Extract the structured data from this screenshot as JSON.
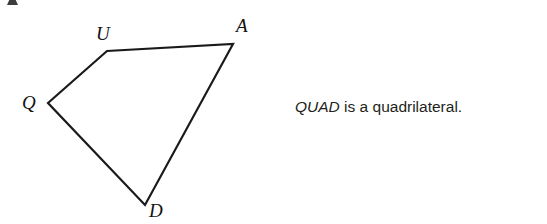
{
  "canvas": {
    "width": 547,
    "height": 224,
    "background_color": "#ffffff"
  },
  "figure": {
    "name": "QUAD",
    "shape_type": "quadrilateral",
    "stroke_color": "#1a1a1a",
    "stroke_width": 2.2,
    "fill": "none",
    "vertices": [
      {
        "label": "Q",
        "x": 48,
        "y": 103,
        "label_x": 22,
        "label_y": 93
      },
      {
        "label": "U",
        "x": 107,
        "y": 51,
        "label_x": 96,
        "label_y": 24
      },
      {
        "label": "A",
        "x": 233,
        "y": 44,
        "label_x": 236,
        "label_y": 16
      },
      {
        "label": "D",
        "x": 145,
        "y": 205,
        "label_x": 149,
        "label_y": 201
      }
    ],
    "edges": [
      {
        "from": "Q",
        "to": "U"
      },
      {
        "from": "U",
        "to": "A"
      },
      {
        "from": "A",
        "to": "D"
      },
      {
        "from": "D",
        "to": "Q"
      }
    ],
    "path": "M 48 103 L 107 51 L 233 44 L 145 205 Z"
  },
  "caption": {
    "figure_name": "QUAD",
    "predicate": " is a quadrilateral.",
    "full_text": "QUAD is a quadrilateral.",
    "text_color": "#231f20"
  },
  "artifacts": {
    "top_left_fragment": "cropped-glyph-fragment"
  }
}
